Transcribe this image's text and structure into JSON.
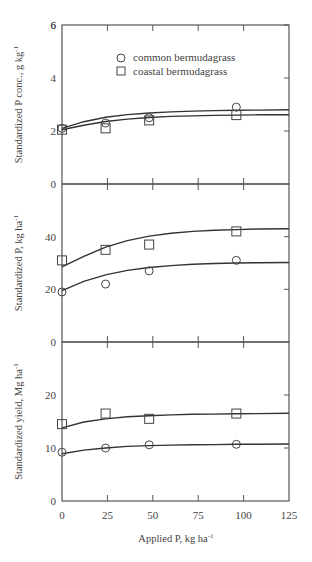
{
  "chart_data": [
    {
      "type": "scatter",
      "title": "",
      "xlabel": "Applied P, kg ha-1",
      "ylabel": "Standardized P conc., g kg-1",
      "xlim": [
        0,
        125
      ],
      "ylim": [
        0,
        6
      ],
      "xticks": [
        0,
        25,
        50,
        75,
        100,
        125
      ],
      "yticks": [
        0,
        2,
        4,
        6
      ],
      "grid": false,
      "legend": {
        "position": "upper-center",
        "entries": [
          "common bermudagrass",
          "coastal bermudagrass"
        ]
      },
      "series": [
        {
          "name": "common bermudagrass",
          "marker": "circle",
          "x": [
            0,
            24,
            48,
            96
          ],
          "values": [
            2.1,
            2.3,
            2.5,
            2.9
          ],
          "fit_x": [
            0,
            12,
            24,
            36,
            48,
            60,
            72,
            84,
            96,
            108,
            125
          ],
          "fit": [
            2.1,
            2.35,
            2.52,
            2.62,
            2.68,
            2.72,
            2.75,
            2.77,
            2.78,
            2.79,
            2.8
          ]
        },
        {
          "name": "coastal bermudagrass",
          "marker": "square",
          "x": [
            0,
            24,
            48,
            96
          ],
          "values": [
            2.05,
            2.1,
            2.4,
            2.6
          ],
          "fit_x": [
            0,
            12,
            24,
            36,
            48,
            60,
            72,
            84,
            96,
            108,
            125
          ],
          "fit": [
            2.05,
            2.22,
            2.36,
            2.45,
            2.51,
            2.55,
            2.57,
            2.59,
            2.6,
            2.61,
            2.61
          ]
        }
      ]
    },
    {
      "type": "scatter",
      "title": "",
      "xlabel": "Applied P, kg ha-1",
      "ylabel": "Standardized P, kg ha-1",
      "xlim": [
        0,
        125
      ],
      "ylim": [
        0,
        60
      ],
      "xticks": [
        0,
        25,
        50,
        75,
        100,
        125
      ],
      "yticks": [
        0,
        20,
        40
      ],
      "grid": false,
      "series": [
        {
          "name": "common bermudagrass",
          "marker": "circle",
          "x": [
            0,
            24,
            48,
            96
          ],
          "values": [
            19,
            22,
            27,
            31
          ],
          "fit_x": [
            0,
            12,
            24,
            36,
            48,
            60,
            72,
            84,
            96,
            108,
            125
          ],
          "fit": [
            19.5,
            23,
            25.5,
            27.2,
            28.3,
            29,
            29.5,
            29.8,
            30,
            30.1,
            30.2
          ]
        },
        {
          "name": "coastal bermudagrass",
          "marker": "square",
          "x": [
            0,
            24,
            48,
            96
          ],
          "values": [
            31,
            35,
            37,
            42
          ],
          "fit_x": [
            0,
            12,
            24,
            36,
            48,
            60,
            72,
            84,
            96,
            108,
            125
          ],
          "fit": [
            28.5,
            32.5,
            36,
            38.5,
            40.2,
            41.3,
            42,
            42.4,
            42.7,
            42.9,
            43
          ]
        }
      ]
    },
    {
      "type": "scatter",
      "title": "",
      "xlabel": "Applied P, kg ha-1",
      "ylabel": "Standardized yield, Mg ha-1",
      "xlim": [
        0,
        125
      ],
      "ylim": [
        0,
        30
      ],
      "xticks": [
        0,
        25,
        50,
        75,
        100,
        125
      ],
      "yticks": [
        0,
        10,
        20
      ],
      "grid": false,
      "series": [
        {
          "name": "common bermudagrass",
          "marker": "circle",
          "x": [
            0,
            24,
            48,
            96
          ],
          "values": [
            9.2,
            10,
            10.6,
            10.7
          ],
          "fit_x": [
            0,
            12,
            24,
            36,
            48,
            60,
            72,
            84,
            96,
            108,
            125
          ],
          "fit": [
            8.9,
            9.6,
            10.0,
            10.3,
            10.45,
            10.55,
            10.6,
            10.65,
            10.7,
            10.72,
            10.75
          ]
        },
        {
          "name": "coastal bermudagrass",
          "marker": "square",
          "x": [
            0,
            24,
            48,
            96
          ],
          "values": [
            14.5,
            16.5,
            15.5,
            16.5
          ],
          "fit_x": [
            0,
            12,
            24,
            36,
            48,
            60,
            72,
            84,
            96,
            108,
            125
          ],
          "fit": [
            13.8,
            14.9,
            15.5,
            15.9,
            16.1,
            16.25,
            16.35,
            16.4,
            16.45,
            16.5,
            16.55
          ]
        }
      ]
    }
  ],
  "labels": {
    "x_title": "Applied P, kg ha",
    "x_title_sup": "-1",
    "y_titles": [
      "Standardized P conc., g kg",
      "Standardized P, kg ha",
      "Standardized yield, Mg ha"
    ],
    "y_title_sup": "-1",
    "legend": [
      "common bermudagrass",
      "coastal bermudagrass"
    ]
  },
  "colors": {
    "line": "#333333",
    "axis": "#555555",
    "text": "#444444"
  }
}
